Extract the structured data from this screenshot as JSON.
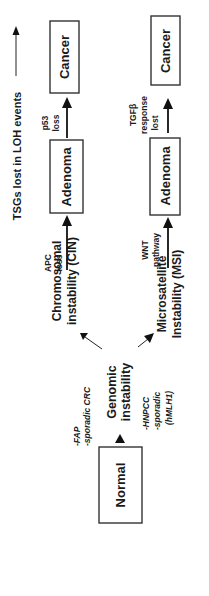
{
  "figure": {
    "orientation": "rotated-90-ccw",
    "legend": {
      "label": "TSGs lost in LOH events",
      "arrow": "arrow-up-icon"
    },
    "nodes": {
      "normal": "Normal",
      "genomic": {
        "line1": "Genomic",
        "line2": "instability"
      },
      "cin": {
        "line1": "Chromosomal",
        "line2": "instability (CIN)"
      },
      "msi": {
        "line1": "Microsatellite",
        "line2": "Instability (MSI)"
      },
      "adenoma_cin": "Adenoma",
      "adenoma_msi": "Adenoma",
      "cancer_cin": "Cancer",
      "cancer_msi": "Cancer"
    },
    "annotations": {
      "fap": {
        "line1": "-FAP",
        "line2": "-sporadic CRC"
      },
      "hnpcc": {
        "line1": "-HNPCC",
        "line2": "-sporadic",
        "line3": "(hMLH1)"
      },
      "apc": {
        "line1": "APC",
        "line2": "loss"
      },
      "wnt": {
        "line1": "WNT",
        "line2": "pathway"
      },
      "p53": {
        "line1": "p53",
        "line2": "loss"
      },
      "tgfb": {
        "line1": "TGFβ",
        "line2": "response",
        "line3": "lost"
      }
    }
  }
}
